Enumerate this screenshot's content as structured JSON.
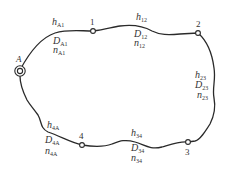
{
  "diagram": {
    "type": "pipe-network-loop",
    "nodes": [
      {
        "id": "A",
        "label": "A",
        "kind": "source"
      },
      {
        "id": "1",
        "label": "1"
      },
      {
        "id": "2",
        "label": "2"
      },
      {
        "id": "3",
        "label": "3"
      },
      {
        "id": "4",
        "label": "4"
      }
    ],
    "segments": [
      {
        "id": "A1",
        "h": "h",
        "h_sub": "A1",
        "D": "D",
        "D_sub": "A1",
        "n": "n",
        "n_sub": "A1"
      },
      {
        "id": "12",
        "h": "h",
        "h_sub": "12",
        "D": "D",
        "D_sub": "12",
        "n": "n",
        "n_sub": "12"
      },
      {
        "id": "23",
        "h": "h",
        "h_sub": "23",
        "D": "D",
        "D_sub": "23",
        "n": "n",
        "n_sub": "23"
      },
      {
        "id": "34",
        "h": "h",
        "h_sub": "34",
        "D": "D",
        "D_sub": "34",
        "n": "n",
        "n_sub": "34"
      },
      {
        "id": "4A",
        "h": "h",
        "h_sub": "4A",
        "D": "D",
        "D_sub": "4A",
        "n": "n",
        "n_sub": "4A"
      }
    ],
    "line_color": "#2a2a2a"
  }
}
